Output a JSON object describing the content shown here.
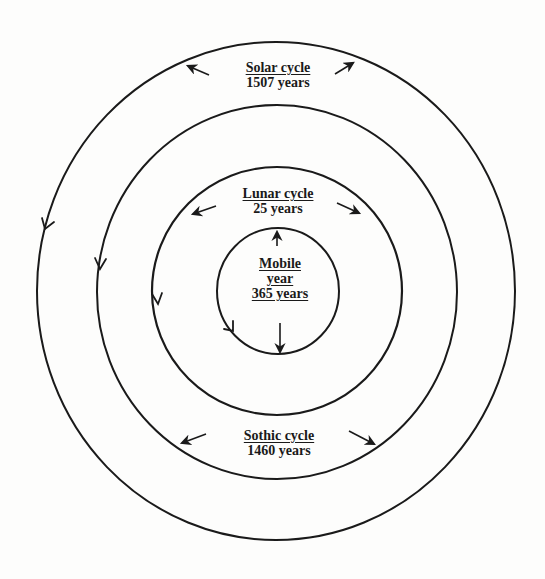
{
  "diagram": {
    "stroke_color": "#1a1a1a",
    "background": "#fdfdfc",
    "cycles": [
      {
        "id": "solar",
        "title": "Solar cycle",
        "duration": "1507 years",
        "ring": "outermost"
      },
      {
        "id": "sothic",
        "title": "Sothic cycle",
        "duration": "1460 years",
        "ring": "second"
      },
      {
        "id": "lunar",
        "title": "Lunar cycle",
        "duration": "25 years",
        "ring": "third"
      },
      {
        "id": "mobile",
        "title_line1": "Mobile",
        "title_line2": "year",
        "duration": "365 years",
        "ring": "innermost"
      }
    ],
    "arrows": {
      "direction_on_rings": "counter-clockwise (downward on left side)",
      "label_arrows": "point outward from labels toward adjacent ring"
    }
  }
}
